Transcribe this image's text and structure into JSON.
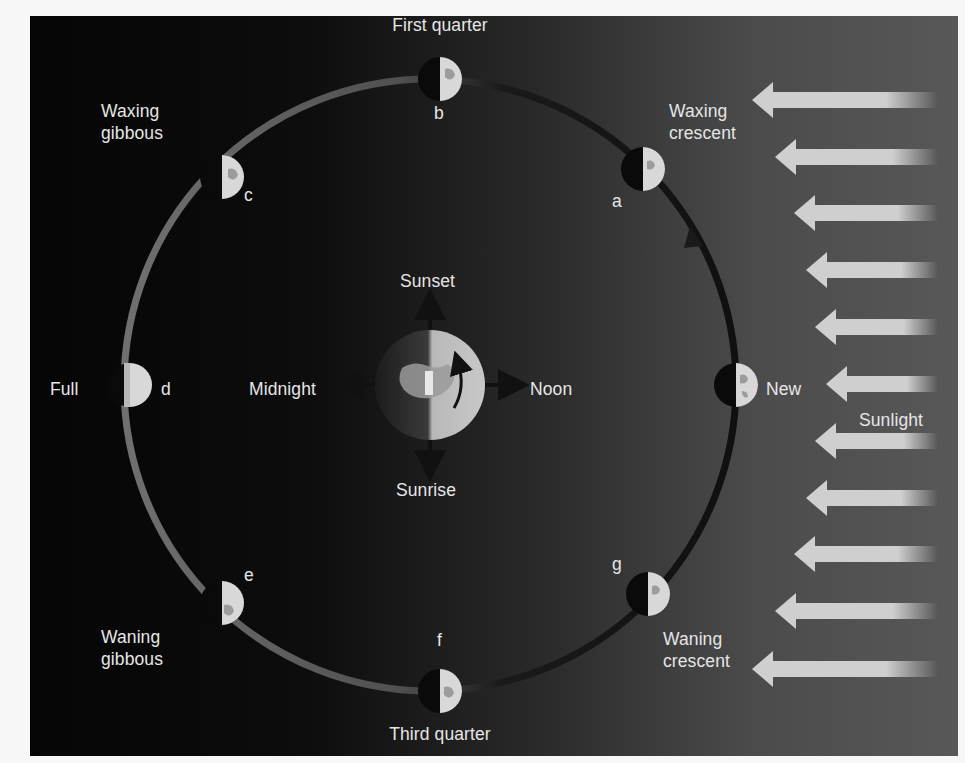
{
  "diagram": {
    "colors": {
      "background_dark": "#050505",
      "background_light": "#585858",
      "orbit_lit": "#6e6e6e",
      "orbit_dark": "#141414",
      "moon_lit": "#d8d8d8",
      "moon_dark": "#0a0a0a",
      "sun_arrow": "#cfcfcf",
      "text": "#e6e6e6"
    },
    "sunlight": {
      "label": "Sunlight",
      "arrow_count": 11,
      "direction": "right-to-left"
    },
    "earth": {
      "directions": {
        "top": "Sunset",
        "left": "Midnight",
        "right": "Noon",
        "bottom": "Sunrise"
      },
      "rotation": "counterclockwise"
    },
    "orbit": {
      "direction": "counterclockwise"
    },
    "phases": [
      {
        "letter": "",
        "name": "New",
        "label": "New"
      },
      {
        "letter": "a",
        "name": "Waxing crescent",
        "label": "Waxing\ncrescent"
      },
      {
        "letter": "b",
        "name": "First quarter",
        "label": "First quarter"
      },
      {
        "letter": "c",
        "name": "Waxing gibbous",
        "label": "Waxing\ngibbous"
      },
      {
        "letter": "d",
        "name": "Full",
        "label": "Full"
      },
      {
        "letter": "e",
        "name": "Waning gibbous",
        "label": "Waning\ngibbous"
      },
      {
        "letter": "f",
        "name": "Third quarter",
        "label": "Third quarter"
      },
      {
        "letter": "g",
        "name": "Waning crescent",
        "label": "Waning\ncrescent"
      }
    ]
  }
}
